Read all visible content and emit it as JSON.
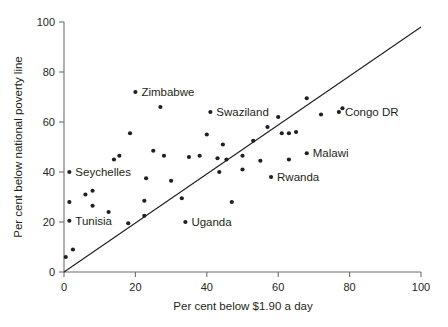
{
  "chart_data": {
    "type": "scatter",
    "title": "",
    "xlabel": "Per cent below $1.90 a day",
    "ylabel": "Per cent below national poverty line",
    "xlim": [
      0,
      100
    ],
    "ylim": [
      0,
      100
    ],
    "xticks": [
      0,
      20,
      40,
      60,
      80,
      100
    ],
    "yticks": [
      0,
      20,
      40,
      60,
      80,
      100
    ],
    "xtick_labels": [
      "0",
      "20",
      "40",
      "60",
      "80",
      "100"
    ],
    "ytick_labels": [
      "0",
      "20",
      "40",
      "60",
      "80",
      "100"
    ],
    "grid": false,
    "legend": false,
    "reference_line": {
      "name": "parity-line",
      "type": "line",
      "x": [
        0,
        100
      ],
      "y": [
        0,
        98
      ],
      "description": "45 degree parity line"
    },
    "points": [
      {
        "x": 0.5,
        "y": 6,
        "label": ""
      },
      {
        "x": 2.5,
        "y": 9,
        "label": ""
      },
      {
        "x": 1.5,
        "y": 20.5,
        "label": "Tunisia",
        "label_pos": "right"
      },
      {
        "x": 1.5,
        "y": 28,
        "label": ""
      },
      {
        "x": 1.5,
        "y": 40,
        "label": "Seychelles",
        "label_pos": "right"
      },
      {
        "x": 6,
        "y": 31,
        "label": ""
      },
      {
        "x": 8,
        "y": 32.5,
        "label": ""
      },
      {
        "x": 8,
        "y": 26.5,
        "label": ""
      },
      {
        "x": 12.5,
        "y": 24,
        "label": ""
      },
      {
        "x": 14,
        "y": 45,
        "label": ""
      },
      {
        "x": 15.5,
        "y": 46.5,
        "label": ""
      },
      {
        "x": 18,
        "y": 19.5,
        "label": ""
      },
      {
        "x": 18.5,
        "y": 55.5,
        "label": ""
      },
      {
        "x": 20,
        "y": 72,
        "label": "Zimbabwe",
        "label_pos": "right"
      },
      {
        "x": 22.5,
        "y": 22.5,
        "label": ""
      },
      {
        "x": 22.5,
        "y": 28.5,
        "label": ""
      },
      {
        "x": 23,
        "y": 37.5,
        "label": ""
      },
      {
        "x": 25,
        "y": 48.5,
        "label": ""
      },
      {
        "x": 27,
        "y": 66,
        "label": ""
      },
      {
        "x": 28,
        "y": 46.5,
        "label": ""
      },
      {
        "x": 30,
        "y": 36.5,
        "label": ""
      },
      {
        "x": 33,
        "y": 29.5,
        "label": ""
      },
      {
        "x": 34,
        "y": 20,
        "label": "Uganda",
        "label_pos": "right"
      },
      {
        "x": 35,
        "y": 46,
        "label": ""
      },
      {
        "x": 38,
        "y": 46.5,
        "label": ""
      },
      {
        "x": 40,
        "y": 55,
        "label": ""
      },
      {
        "x": 41,
        "y": 64,
        "label": "Swaziland",
        "label_pos": "right"
      },
      {
        "x": 43,
        "y": 45.5,
        "label": ""
      },
      {
        "x": 43.5,
        "y": 40,
        "label": ""
      },
      {
        "x": 44.5,
        "y": 51,
        "label": ""
      },
      {
        "x": 45.5,
        "y": 45,
        "label": ""
      },
      {
        "x": 47,
        "y": 28,
        "label": ""
      },
      {
        "x": 50,
        "y": 46.5,
        "label": ""
      },
      {
        "x": 50,
        "y": 41,
        "label": ""
      },
      {
        "x": 53,
        "y": 52.5,
        "label": ""
      },
      {
        "x": 55,
        "y": 44.5,
        "label": ""
      },
      {
        "x": 57,
        "y": 58,
        "label": ""
      },
      {
        "x": 58,
        "y": 38,
        "label": "Rwanda",
        "label_pos": "right"
      },
      {
        "x": 60,
        "y": 62,
        "label": ""
      },
      {
        "x": 61,
        "y": 55.5,
        "label": ""
      },
      {
        "x": 63,
        "y": 55.5,
        "label": ""
      },
      {
        "x": 63,
        "y": 45,
        "label": ""
      },
      {
        "x": 65,
        "y": 56,
        "label": ""
      },
      {
        "x": 68,
        "y": 47.5,
        "label": "Malawi",
        "label_pos": "right"
      },
      {
        "x": 68,
        "y": 69.5,
        "label": ""
      },
      {
        "x": 72,
        "y": 63,
        "label": ""
      },
      {
        "x": 77,
        "y": 64,
        "label": "Congo DR",
        "label_pos": "right"
      },
      {
        "x": 78,
        "y": 65.5,
        "label": ""
      }
    ]
  }
}
